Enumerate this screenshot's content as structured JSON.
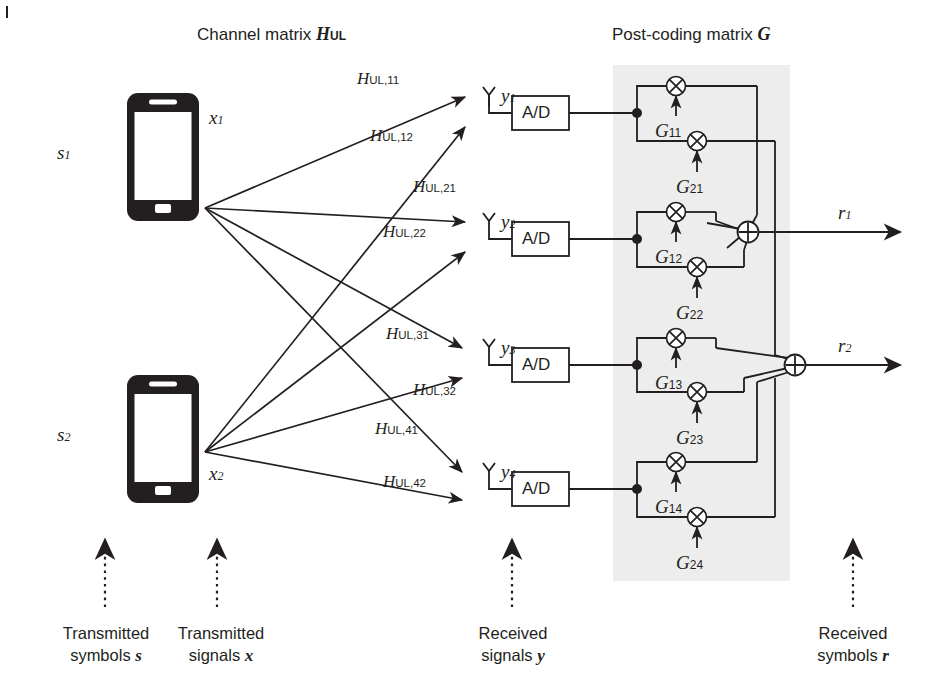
{
  "figure": {
    "kind": "mimo-uplink-block-diagram",
    "titles": {
      "channel": "Channel matrix",
      "channel_symbol": "H",
      "channel_symbol_sub": "UL",
      "postcoding": "Post-coding matrix",
      "postcoding_symbol": "G"
    },
    "accent_colors": {
      "line": "#231f20",
      "shaded_block": "#eeeeee",
      "background": "#ffffff"
    }
  },
  "transmitters": [
    {
      "symbol_label": "s",
      "symbol_sub": "1",
      "signal_label": "x",
      "signal_sub": "1",
      "icon": "smartphone-icon"
    },
    {
      "symbol_label": "s",
      "symbol_sub": "2",
      "signal_label": "x",
      "signal_sub": "2",
      "icon": "smartphone-icon"
    }
  ],
  "channel_paths": [
    {
      "label": "H",
      "sub": "UL,11",
      "from": 1,
      "to": 1
    },
    {
      "label": "H",
      "sub": "UL,12",
      "from": 2,
      "to": 1
    },
    {
      "label": "H",
      "sub": "UL,21",
      "from": 1,
      "to": 2
    },
    {
      "label": "H",
      "sub": "UL,22",
      "from": 2,
      "to": 2
    },
    {
      "label": "H",
      "sub": "UL,31",
      "from": 1,
      "to": 3
    },
    {
      "label": "H",
      "sub": "UL,32",
      "from": 2,
      "to": 3
    },
    {
      "label": "H",
      "sub": "UL,41",
      "from": 1,
      "to": 4
    },
    {
      "label": "H",
      "sub": "UL,42",
      "from": 2,
      "to": 4
    }
  ],
  "receive_chains": [
    {
      "antenna_icon": "antenna-icon",
      "signal_label": "y",
      "signal_sub": "1",
      "converter_label": "A/D"
    },
    {
      "antenna_icon": "antenna-icon",
      "signal_label": "y",
      "signal_sub": "2",
      "converter_label": "A/D"
    },
    {
      "antenna_icon": "antenna-icon",
      "signal_label": "y",
      "signal_sub": "3",
      "converter_label": "A/D"
    },
    {
      "antenna_icon": "antenna-icon",
      "signal_label": "y",
      "signal_sub": "4",
      "converter_label": "A/D"
    }
  ],
  "postcoding_gains": [
    {
      "label": "G",
      "sub": "11",
      "row": 1,
      "col": 1
    },
    {
      "label": "G",
      "sub": "21",
      "row": 2,
      "col": 1
    },
    {
      "label": "G",
      "sub": "12",
      "row": 1,
      "col": 2
    },
    {
      "label": "G",
      "sub": "22",
      "row": 2,
      "col": 2
    },
    {
      "label": "G",
      "sub": "13",
      "row": 1,
      "col": 3
    },
    {
      "label": "G",
      "sub": "23",
      "row": 2,
      "col": 3
    },
    {
      "label": "G",
      "sub": "14",
      "row": 1,
      "col": 4
    },
    {
      "label": "G",
      "sub": "24",
      "row": 2,
      "col": 4
    }
  ],
  "outputs": [
    {
      "label": "r",
      "sub": "1"
    },
    {
      "label": "r",
      "sub": "2"
    }
  ],
  "stage_captions": [
    {
      "line1": "Transmitted",
      "line2": "symbols",
      "vector": "s"
    },
    {
      "line1": "Transmitted",
      "line2": "signals",
      "vector": "x"
    },
    {
      "line1": "Received",
      "line2": "signals",
      "vector": "y"
    },
    {
      "line1": "Received",
      "line2": "symbols",
      "vector": "r"
    }
  ],
  "operator_icons": {
    "multiplier": "circled-times-icon",
    "adder": "circled-plus-icon",
    "junction": "junction-dot-icon"
  }
}
